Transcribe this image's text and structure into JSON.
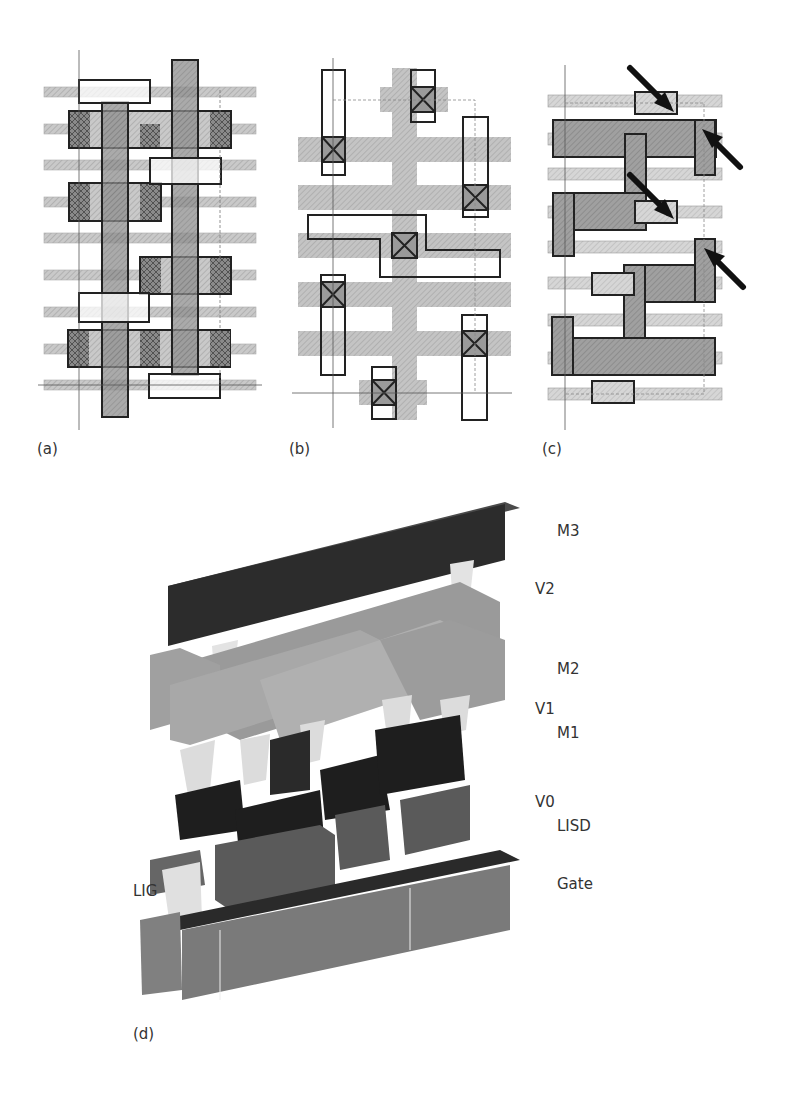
{
  "figure": {
    "panels": [
      {
        "id": "a",
        "label": "(a)",
        "description": "Standard cell layout with gates, diffusion contacts and horizontal metal tracks"
      },
      {
        "id": "b",
        "label": "(b)",
        "description": "Layout with vertical poly/gate and contact vias (crossed boxes)"
      },
      {
        "id": "c",
        "label": "(c)",
        "description": "Layout with arrows indicating line-end / via issues"
      },
      {
        "id": "d",
        "label": "(d)",
        "description": "3D view of the interconnect stack"
      }
    ],
    "stack_layers": [
      {
        "name": "M3",
        "label": "M3"
      },
      {
        "name": "V2",
        "label": "V2"
      },
      {
        "name": "M2",
        "label": "M2"
      },
      {
        "name": "V1",
        "label": "V1"
      },
      {
        "name": "M1",
        "label": "M1"
      },
      {
        "name": "V0",
        "label": "V0"
      },
      {
        "name": "LISD",
        "label": "LISD"
      },
      {
        "name": "Gate",
        "label": "Gate"
      },
      {
        "name": "LIG",
        "label": "LIG"
      }
    ],
    "colors": {
      "track_light": "#d8d8d8",
      "shape_mid": "#a9a9a9",
      "shape_dark": "#7a7a7a",
      "metal_black": "#222222",
      "m3_dark": "#2f2f2f",
      "via_light": "#e6e6e6",
      "m2_gray": "#9d9d9d",
      "gate_gray": "#7f7f7f",
      "lisd_gray": "#5c5c5c",
      "outline": "#1a1a1a"
    }
  }
}
